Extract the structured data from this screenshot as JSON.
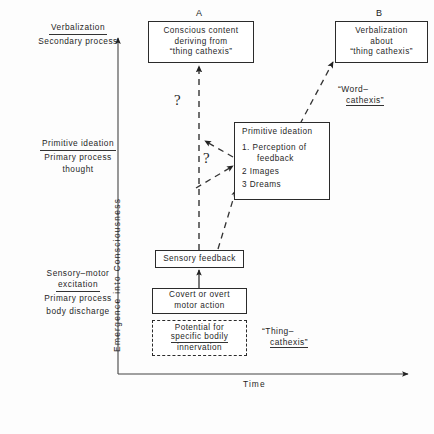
{
  "figure": {
    "axes": {
      "y_label": "Emergence   into   Consciousness",
      "x_label": "Time"
    },
    "column_headers": [
      {
        "id": "A",
        "label": "A"
      },
      {
        "id": "B",
        "label": "B"
      }
    ],
    "stage_labels": [
      {
        "id": "verbalization",
        "top": "Verbalization",
        "bottom_lines": [
          "Secondary process"
        ]
      },
      {
        "id": "primitive-ideation",
        "top": "Primitive ideation",
        "bottom_lines": [
          "Primary   process",
          "thought"
        ]
      },
      {
        "id": "sensory-motor",
        "top_lines": [
          "Sensory–motor",
          "excitation"
        ],
        "bottom_lines": [
          "Primary  process",
          "body discharge"
        ]
      }
    ],
    "boxes": [
      {
        "id": "conscious-content",
        "lines": [
          "Conscious  content",
          "deriving  from",
          "“thing  cathexis”"
        ],
        "style": "solid"
      },
      {
        "id": "verbalization-about",
        "lines": [
          "Verbalization",
          "about",
          "“thing  cathexis”"
        ],
        "style": "solid"
      },
      {
        "id": "primitive-ideation-box",
        "header": "Primitive  ideation",
        "items": [
          {
            "num": "1.",
            "text": "Perception  of",
            "cont": "feedback"
          },
          {
            "num": "2",
            "text": "Images",
            "cont": ""
          },
          {
            "num": "3",
            "text": "Dreams",
            "cont": ""
          }
        ],
        "style": "solid"
      },
      {
        "id": "sensory-feedback",
        "lines": [
          "Sensory  feedback"
        ],
        "style": "solid"
      },
      {
        "id": "covert-overt-motor-action",
        "lines": [
          "Covert  or  overt",
          "motor  action"
        ],
        "style": "solid"
      },
      {
        "id": "potential-bodily-innervation",
        "lines": [
          "Potential  for",
          "specific  bodily",
          "innervation"
        ],
        "underline_line_index": 1,
        "style": "dashed"
      }
    ],
    "annotations": [
      {
        "id": "word-cathexis",
        "line1": "“Word–",
        "line2": "cathexis”",
        "underline_line2": true
      },
      {
        "id": "thing-cathexis",
        "line1": "“Thing–",
        "line2": "cathexis”",
        "underline_line2": true
      },
      {
        "id": "question-mark-upper",
        "text": "?"
      },
      {
        "id": "question-mark-lower",
        "text": "?"
      }
    ],
    "colors": {
      "ink": "#1f1f1f",
      "stroke": "#2b2b2b",
      "background": "#fdfdfd"
    }
  }
}
